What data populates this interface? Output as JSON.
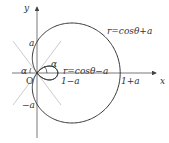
{
  "diagram": {
    "type": "polar-curves",
    "parameter_a": 0.6,
    "axes": {
      "x_label": "x",
      "y_label": "y",
      "origin_label": "O"
    },
    "curves": [
      {
        "name": "outer-limacon",
        "equation": "r=cosθ+a",
        "color": "#333333"
      },
      {
        "name": "inner-loop",
        "equation": "r=cosθ−a",
        "color": "#333333"
      }
    ],
    "tick_labels": {
      "a_pos_y": "a",
      "a_neg_y": "−a",
      "one_minus_a": "1−a",
      "one_plus_a": "1+a"
    },
    "angle_labels": {
      "left": "α",
      "right": "α"
    },
    "colors": {
      "curve": "#333333",
      "axis": "#555555",
      "guide_lines": "#cccccc"
    }
  }
}
